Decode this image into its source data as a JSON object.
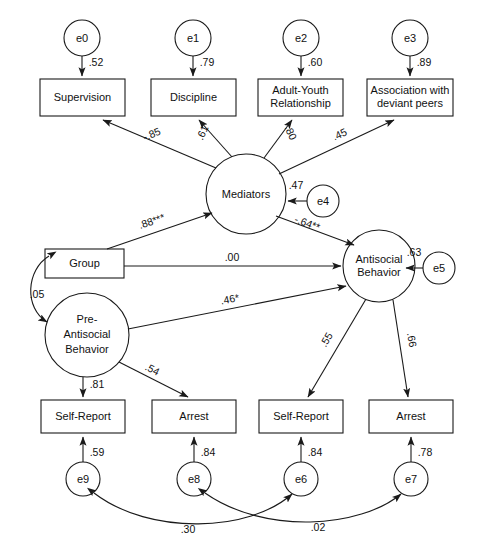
{
  "figure": {
    "type": "sem-path-diagram"
  },
  "indicators_top": [
    {
      "id": "supervision",
      "label": "Supervision",
      "lines": [
        "Supervision"
      ]
    },
    {
      "id": "discipline",
      "label": "Discipline",
      "lines": [
        "Discipline"
      ]
    },
    {
      "id": "adult-youth",
      "label": "Adult-Youth Relationship",
      "lines": [
        "Adult-Youth",
        "Relationship"
      ]
    },
    {
      "id": "deviant-peers",
      "label": "Association with deviant peers",
      "lines": [
        "Association with",
        "deviant peers"
      ]
    }
  ],
  "indicators_bottom": [
    {
      "id": "self-report-pre",
      "label": "Self-Report",
      "lines": [
        "Self-Report"
      ]
    },
    {
      "id": "arrest-pre",
      "label": "Arrest",
      "lines": [
        "Arrest"
      ]
    },
    {
      "id": "self-report-post",
      "label": "Self-Report",
      "lines": [
        "Self-Report"
      ]
    },
    {
      "id": "arrest-post",
      "label": "Arrest",
      "lines": [
        "Arrest"
      ]
    }
  ],
  "latents": [
    {
      "id": "mediators",
      "label": "Mediators",
      "lines": [
        "Mediators"
      ]
    },
    {
      "id": "antisocial",
      "label": "Antisocial Behavior",
      "lines": [
        "Antisocial",
        "Behavior"
      ]
    },
    {
      "id": "pre-antisocial",
      "label": "Pre-Antisocial Behavior",
      "lines": [
        "Pre-",
        "Antisocial",
        "Behavior"
      ]
    }
  ],
  "observed": [
    {
      "id": "group",
      "label": "Group",
      "lines": [
        "Group"
      ]
    }
  ],
  "errors": [
    {
      "id": "e0",
      "label": "e0"
    },
    {
      "id": "e1",
      "label": "e1"
    },
    {
      "id": "e2",
      "label": "e2"
    },
    {
      "id": "e3",
      "label": "e3"
    },
    {
      "id": "e4",
      "label": "e4"
    },
    {
      "id": "e5",
      "label": "e5"
    },
    {
      "id": "e6",
      "label": "e6"
    },
    {
      "id": "e7",
      "label": "e7"
    },
    {
      "id": "e8",
      "label": "e8"
    },
    {
      "id": "e9",
      "label": "e9"
    }
  ],
  "coefficients": {
    "e0_supervision": ".52",
    "e1_discipline": ".79",
    "e2_adultyouth": ".60",
    "e3_deviantpeers": ".89",
    "mediators_supervision": "-.85",
    "mediators_discipline": ".61",
    "mediators_adultyouth": ".80",
    "mediators_deviantpeers": ".45",
    "e4_mediators": ".47",
    "group_mediators": ".88***",
    "mediators_antisocial": "-.64**",
    "group_antisocial": ".00",
    "preantisocial_antisocial": ".46*",
    "group_preantisocial": ".05",
    "e5_antisocial": ".63",
    "preantisocial_selfreport": ".81",
    "preantisocial_arrest": ".54",
    "antisocial_selfreport": ".55",
    "antisocial_arrest": ".66",
    "e9_selfreport": ".59",
    "e8_arrest": ".84",
    "e6_selfreport": ".84",
    "e7_arrest": ".78",
    "e9_e6_covariance": ".30",
    "e8_e7_covariance": ".02"
  },
  "colors": {
    "stroke": "#1a1a1a",
    "fill": "#ffffff",
    "text": "#111111"
  }
}
